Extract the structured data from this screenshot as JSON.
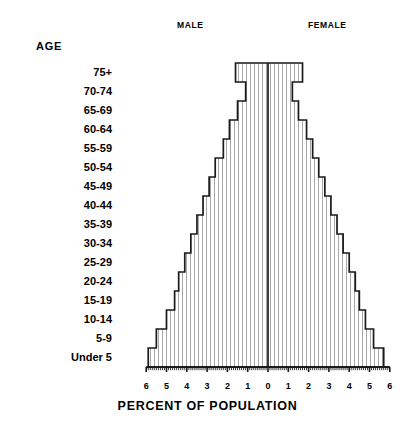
{
  "header": {
    "male_label": "MALE",
    "female_label": "FEMALE",
    "age_header": "AGE"
  },
  "axis": {
    "x_title": "PERCENT OF POPULATION",
    "x_tick_labels": [
      "6",
      "5",
      "4",
      "3",
      "2",
      "1",
      "0",
      "1",
      "2",
      "3",
      "4",
      "5",
      "6"
    ]
  },
  "colors": {
    "outline": "#1a1a1a",
    "hatch": "#8c8c8c",
    "background": "#ffffff",
    "text": "#000000"
  },
  "chart_data": {
    "type": "bar",
    "subtype": "population-pyramid",
    "title": "",
    "xlabel": "PERCENT OF POPULATION",
    "ylabel": "AGE",
    "xlim": [
      -6,
      6
    ],
    "x_ticks": [
      -6,
      -5,
      -4,
      -3,
      -2,
      -1,
      0,
      1,
      2,
      3,
      4,
      5,
      6
    ],
    "x_tick_labels": [
      "6",
      "5",
      "4",
      "3",
      "2",
      "1",
      "0",
      "1",
      "2",
      "3",
      "4",
      "5",
      "6"
    ],
    "grid": false,
    "legend": [
      "MALE",
      "FEMALE"
    ],
    "legend_position": "top",
    "orientation": "horizontal",
    "categories": [
      "75+",
      "70-74",
      "65-69",
      "60-64",
      "55-59",
      "50-54",
      "45-49",
      "40-44",
      "35-39",
      "30-34",
      "25-29",
      "20-24",
      "15-19",
      "10-14",
      "5-9",
      "Under 5"
    ],
    "series": [
      {
        "name": "MALE",
        "side": "left",
        "values": [
          1.6,
          1.1,
          1.5,
          1.9,
          2.2,
          2.6,
          2.9,
          3.2,
          3.5,
          3.8,
          4.1,
          4.4,
          4.6,
          5.0,
          5.5,
          5.9
        ]
      },
      {
        "name": "FEMALE",
        "side": "right",
        "values": [
          1.7,
          1.2,
          1.5,
          1.9,
          2.2,
          2.5,
          2.8,
          3.1,
          3.4,
          3.7,
          4.0,
          4.3,
          4.5,
          4.8,
          5.2,
          5.7
        ]
      }
    ]
  }
}
